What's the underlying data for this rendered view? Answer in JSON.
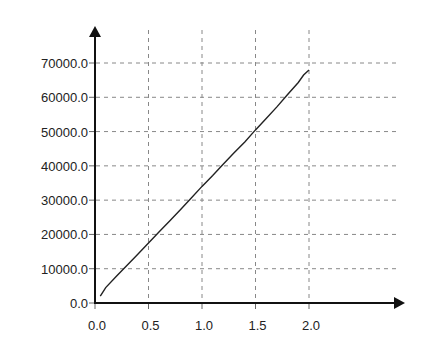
{
  "chart_data": {
    "type": "line",
    "title": "",
    "xlabel": "",
    "ylabel": "",
    "xlim": [
      0.0,
      2.0
    ],
    "ylim": [
      0.0,
      70000.0
    ],
    "grid": true,
    "legend": null,
    "x_ticks": [
      "0.0",
      "0.5",
      "1.0",
      "1.5",
      "2.0"
    ],
    "y_ticks": [
      "0.0",
      "10000.0",
      "20000.0",
      "30000.0",
      "40000.0",
      "50000.0",
      "60000.0",
      "70000.0"
    ],
    "series": [
      {
        "name": "series-1",
        "color": "#222222",
        "x": [
          0.05,
          0.1,
          0.2,
          0.3,
          0.4,
          0.5,
          0.6,
          0.7,
          0.8,
          0.9,
          1.0,
          1.1,
          1.2,
          1.3,
          1.4,
          1.5,
          1.6,
          1.7,
          1.8,
          1.9,
          1.95,
          2.0
        ],
        "y": [
          2000,
          4500,
          7800,
          11000,
          14200,
          17500,
          20800,
          24000,
          27300,
          30600,
          34000,
          37200,
          40500,
          43800,
          47000,
          50500,
          53800,
          57200,
          60800,
          64300,
          66500,
          68000
        ]
      }
    ]
  }
}
